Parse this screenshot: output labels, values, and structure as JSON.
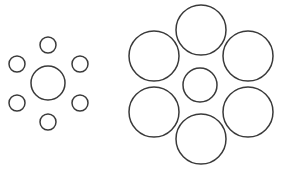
{
  "diagram": {
    "type": "ebbinghaus-illusion",
    "stroke_color": "#3a3a3a",
    "background": "#ffffff",
    "left_group": {
      "center": {
        "cx": 48,
        "cy": 83,
        "r": 17
      },
      "surround": [
        {
          "cx": 48,
          "cy": 45,
          "r": 8
        },
        {
          "cx": 17,
          "cy": 64,
          "r": 8
        },
        {
          "cx": 80,
          "cy": 64,
          "r": 8
        },
        {
          "cx": 17,
          "cy": 103,
          "r": 8
        },
        {
          "cx": 80,
          "cy": 103,
          "r": 8
        },
        {
          "cx": 48,
          "cy": 122,
          "r": 8
        }
      ]
    },
    "right_group": {
      "center": {
        "cx": 200,
        "cy": 85,
        "r": 17
      },
      "surround": [
        {
          "cx": 201,
          "cy": 30,
          "r": 25
        },
        {
          "cx": 154,
          "cy": 56,
          "r": 25
        },
        {
          "cx": 248,
          "cy": 56,
          "r": 25
        },
        {
          "cx": 154,
          "cy": 112,
          "r": 25
        },
        {
          "cx": 248,
          "cy": 112,
          "r": 25
        },
        {
          "cx": 201,
          "cy": 139,
          "r": 25
        }
      ]
    }
  }
}
